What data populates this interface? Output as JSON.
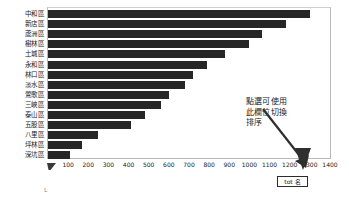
{
  "chart_data": {
    "type": "bar",
    "orientation": "horizontal",
    "title": "",
    "xlabel": "",
    "ylabel": "",
    "xlim": [
      0,
      1400
    ],
    "xticks": [
      100,
      200,
      300,
      400,
      500,
      600,
      700,
      800,
      900,
      1000,
      1100,
      1200,
      1300,
      1400
    ],
    "grid": false,
    "bar_color": "#262626",
    "categories": [
      "中和區",
      "新店區",
      "蘆洲區",
      "樹林區",
      "土城區",
      "永和區",
      "林口區",
      "淡水區",
      "鶯歌區",
      "三峽區",
      "泰山區",
      "五股區",
      "八里區",
      "坪林區",
      "深坑區"
    ],
    "values": [
      1300,
      1180,
      1060,
      1000,
      880,
      790,
      720,
      680,
      600,
      560,
      480,
      410,
      250,
      170,
      110
    ]
  },
  "annotation": {
    "line1": "點選可使用",
    "line2": "此欄位切換",
    "line3": "排序"
  },
  "field_box": {
    "label": "tot 名"
  },
  "axis": {
    "corner_mark": "L"
  }
}
